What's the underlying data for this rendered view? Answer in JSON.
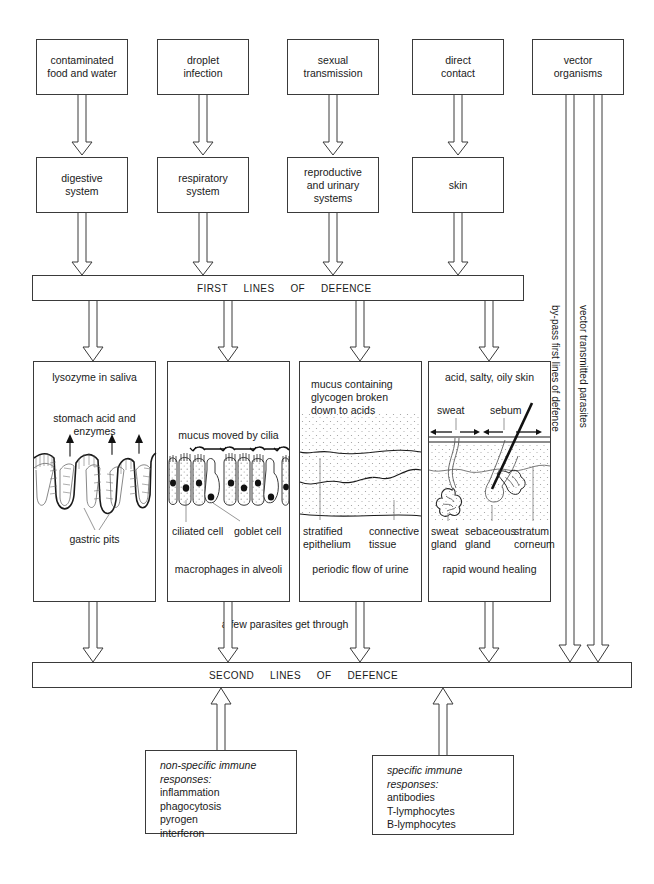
{
  "diagram": {
    "entry_routes": [
      {
        "id": "contaminated-food-water",
        "label": "contaminated\nfood and water"
      },
      {
        "id": "droplet-infection",
        "label": "droplet\ninfection"
      },
      {
        "id": "sexual-transmission",
        "label": "sexual\ntransmission"
      },
      {
        "id": "direct-contact",
        "label": "direct\ncontact"
      },
      {
        "id": "vector-organisms",
        "label": "vector\norganisms"
      }
    ],
    "body_systems": [
      {
        "id": "digestive-system",
        "label": "digestive\nsystem"
      },
      {
        "id": "respiratory-system",
        "label": "respiratory\nsystem"
      },
      {
        "id": "reproductive-urinary-systems",
        "label": "reproductive\nand urinary\nsystems"
      },
      {
        "id": "skin",
        "label": "skin"
      }
    ],
    "first_bar_label": "FIRST     LINES     OF     DEFENCE",
    "second_bar_label": "SECOND     LINES     OF     DEFENCE",
    "midnote": "a few parasites get through",
    "vertical_labels": [
      {
        "id": "bypass",
        "label": "by-pass first lines of defence"
      },
      {
        "id": "vector-parasites",
        "label": "vector transmitted parasites"
      }
    ],
    "defence_panels": [
      {
        "id": "digestive-defence",
        "top_caption": "lysozyme in saliva",
        "second_caption": "stomach acid and enzymes",
        "structure_label": "gastric pits",
        "bottom_caption": ""
      },
      {
        "id": "respiratory-defence",
        "top_caption": "",
        "second_caption": "mucus moved by cilia",
        "label_left": "ciliated cell",
        "label_right": "goblet cell",
        "bottom_caption": "macrophages in alveoli"
      },
      {
        "id": "urinary-defence",
        "top_caption": "mucus containing\nglycogen broken\ndown to acids",
        "label_left": "stratified\nepithelium",
        "label_right": "connective\ntissue",
        "bottom_caption": "periodic flow of urine"
      },
      {
        "id": "skin-defence",
        "top_caption": "acid, salty, oily skin",
        "arrow_label_left": "sweat",
        "arrow_label_right": "sebum",
        "label_1": "sweat\ngland",
        "label_2": "sebaceous\ngland",
        "label_3": "stratum\ncorneum",
        "bottom_caption": "rapid wound healing"
      }
    ],
    "immune_boxes": [
      {
        "id": "non-specific-immune-responses",
        "heading": "non-specific immune\nresponses:",
        "items": [
          "inflammation",
          "phagocytosis",
          "pyrogen",
          "interferon"
        ]
      },
      {
        "id": "specific-immune-responses",
        "heading": "specific immune\nresponses:",
        "items": [
          "antibodies",
          "T-lymphocytes",
          "B-lymphocytes"
        ]
      }
    ],
    "colors": {
      "stroke": "#3a3a3a",
      "text": "#1a1a1a",
      "background": "#ffffff",
      "stipple": "#9a9a9a"
    }
  }
}
